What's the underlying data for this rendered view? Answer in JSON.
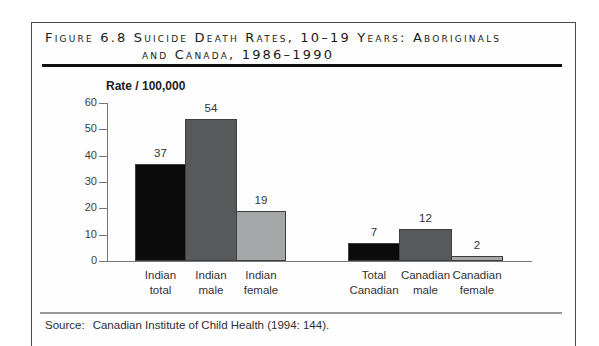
{
  "figure": {
    "title_line1": "Figure 6.8 Suicide Death Rates, 10–19 Years: Aboriginals",
    "title_line2": "and Canada, 1986–1990",
    "source_label": "Source:",
    "source_text": "Canadian Institute of Child Health (1994: 144)."
  },
  "chart_data": {
    "type": "bar",
    "ylabel": "Rate / 100,000",
    "xlabel": "",
    "ylim": [
      0,
      60
    ],
    "yticks": [
      0,
      10,
      20,
      30,
      40,
      50,
      60
    ],
    "grid": false,
    "legend": "none",
    "categories": [
      "Indian total",
      "Indian male",
      "Indian female",
      "Total Canadian",
      "Canadian male",
      "Canadian female"
    ],
    "category_lines": [
      [
        "Indian",
        "total"
      ],
      [
        "Indian",
        "male"
      ],
      [
        "Indian",
        "female"
      ],
      [
        "Total",
        "Canadian"
      ],
      [
        "Canadian",
        "male"
      ],
      [
        "Canadian",
        "female"
      ]
    ],
    "values": [
      37,
      54,
      19,
      7,
      12,
      2
    ],
    "bar_colors": [
      "#0b0b0b",
      "#58595b",
      "#a5a6a8",
      "#0b0b0b",
      "#58595b",
      "#a5a6a8"
    ],
    "groups": [
      [
        0,
        1,
        2
      ],
      [
        3,
        4,
        5
      ]
    ]
  },
  "colors": {
    "bar_black": "#0b0b0b",
    "bar_dark_gray": "#58595b",
    "bar_light_gray": "#a5a6a8",
    "bar_border": "#3f3f3f",
    "axis": "#777777",
    "rule_thick": "#101010",
    "rule_thin": "#9a9a9a",
    "frame_border": "#4a4a4a",
    "text": "#333333"
  }
}
